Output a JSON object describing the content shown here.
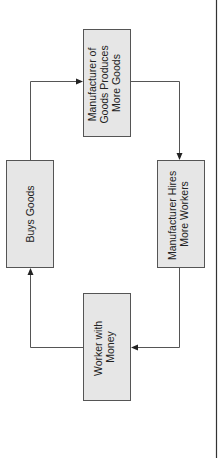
{
  "diagram": {
    "type": "cycle-flowchart",
    "orientation": "rotated-90-ccw",
    "nodes": [
      {
        "id": "manufacturer-produces",
        "lines": [
          "Manufacturer of",
          "Goods Produces",
          "More Goods"
        ]
      },
      {
        "id": "manufacturer-hires",
        "lines": [
          "Manufacturer Hires",
          "More Workers"
        ]
      },
      {
        "id": "worker-money",
        "lines": [
          "Worker with",
          "Money"
        ]
      },
      {
        "id": "buys-goods",
        "lines": [
          "Buys Goods"
        ]
      }
    ],
    "edges": [
      {
        "from": "manufacturer-produces",
        "to": "manufacturer-hires"
      },
      {
        "from": "manufacturer-hires",
        "to": "worker-money"
      },
      {
        "from": "worker-money",
        "to": "buys-goods"
      },
      {
        "from": "buys-goods",
        "to": "manufacturer-produces"
      }
    ],
    "colors": {
      "box_fill": "#e6e6e6",
      "box_stroke": "#555555",
      "line": "#555555"
    }
  }
}
